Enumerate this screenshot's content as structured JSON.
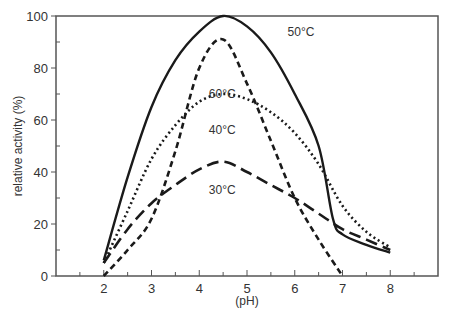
{
  "chart_data": {
    "type": "line",
    "title": "",
    "xlabel": "(pH)",
    "ylabel": "relative activity (%)",
    "xlim": [
      1,
      9
    ],
    "ylim": [
      0,
      100
    ],
    "x_ticks": [
      2,
      3,
      4,
      5,
      6,
      7,
      8
    ],
    "y_ticks": [
      0,
      20,
      40,
      60,
      80,
      100
    ],
    "grid": false,
    "legend_position": "inline labels",
    "series": [
      {
        "name": "50°C",
        "style": "solid",
        "label_pos": [
          5.85,
          94
        ],
        "points": [
          [
            2.0,
            6
          ],
          [
            2.5,
            38
          ],
          [
            3.0,
            65
          ],
          [
            3.5,
            83
          ],
          [
            4.0,
            94
          ],
          [
            4.5,
            100
          ],
          [
            5.0,
            96
          ],
          [
            5.5,
            86
          ],
          [
            6.0,
            70
          ],
          [
            6.5,
            50
          ],
          [
            6.8,
            22
          ],
          [
            7.0,
            16
          ],
          [
            7.5,
            12
          ],
          [
            8.0,
            9
          ]
        ]
      },
      {
        "name": "60°C",
        "style": "short-dash",
        "label_pos": [
          4.2,
          70
        ],
        "points": [
          [
            2.0,
            0
          ],
          [
            2.5,
            10
          ],
          [
            3.0,
            22
          ],
          [
            3.5,
            48
          ],
          [
            4.0,
            80
          ],
          [
            4.5,
            91
          ],
          [
            5.0,
            74
          ],
          [
            5.5,
            52
          ],
          [
            6.0,
            30
          ],
          [
            6.5,
            14
          ],
          [
            7.0,
            0
          ]
        ]
      },
      {
        "name": "40°C",
        "style": "dotted",
        "label_pos": [
          4.2,
          56
        ],
        "points": [
          [
            2.0,
            5
          ],
          [
            2.5,
            25
          ],
          [
            3.0,
            45
          ],
          [
            3.5,
            58
          ],
          [
            4.0,
            67
          ],
          [
            4.5,
            70
          ],
          [
            5.0,
            68
          ],
          [
            5.5,
            63
          ],
          [
            6.0,
            55
          ],
          [
            6.5,
            43
          ],
          [
            7.0,
            27
          ],
          [
            7.5,
            17
          ],
          [
            8.0,
            11
          ]
        ]
      },
      {
        "name": "30°C",
        "style": "long-dash",
        "label_pos": [
          4.2,
          33
        ],
        "points": [
          [
            2.0,
            5
          ],
          [
            2.5,
            18
          ],
          [
            3.0,
            28
          ],
          [
            3.5,
            35
          ],
          [
            4.0,
            41
          ],
          [
            4.5,
            44
          ],
          [
            5.0,
            40
          ],
          [
            5.5,
            35
          ],
          [
            6.0,
            30
          ],
          [
            6.5,
            24
          ],
          [
            7.0,
            18
          ],
          [
            7.5,
            14
          ],
          [
            8.0,
            10
          ]
        ]
      }
    ]
  }
}
